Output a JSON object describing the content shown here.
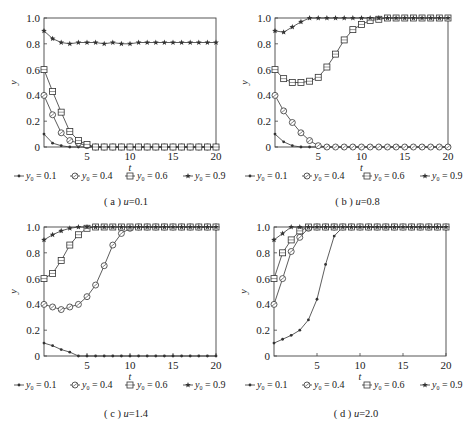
{
  "figure": {
    "legend_prefix": "y",
    "legend_subscript": "0",
    "series_style": {
      "y0_0.1": {
        "marker": "dot",
        "label_value": "0.1"
      },
      "y0_0.4": {
        "marker": "circle",
        "label_value": "0.4"
      },
      "y0_0.6": {
        "marker": "square",
        "label_value": "0.6"
      },
      "y0_0.9": {
        "marker": "star",
        "label_value": "0.9"
      }
    },
    "colors": {
      "line": "#333333",
      "axis": "#444444",
      "background": "#ffffff"
    }
  },
  "chart_data": [
    {
      "type": "line",
      "panel": "a",
      "caption": "( a ) u=0.1",
      "caption_letter": "a",
      "caption_param": "u=0.1",
      "xlabel": "t",
      "ylabel": "y",
      "xlim": [
        0,
        20
      ],
      "ylim": [
        0,
        1.0
      ],
      "xticks": [
        "5",
        "10",
        "15",
        "20"
      ],
      "yticks": [
        "0",
        "0.2",
        "0.4",
        "0.6",
        "0.8",
        "1.0"
      ],
      "grid": false,
      "legend_position": "below",
      "x": [
        0,
        1,
        2,
        3,
        4,
        5,
        6,
        7,
        8,
        9,
        10,
        11,
        12,
        13,
        14,
        15,
        16,
        17,
        18,
        19,
        20
      ],
      "series": [
        {
          "name": "y0 = 0.1",
          "values": [
            0.1,
            0.03,
            0.01,
            0,
            0,
            0,
            0,
            0,
            0,
            0,
            0,
            0,
            0,
            0,
            0,
            0,
            0,
            0,
            0,
            0,
            0
          ]
        },
        {
          "name": "y0 = 0.4",
          "values": [
            0.4,
            0.25,
            0.11,
            0.05,
            0.03,
            0.01,
            0,
            0,
            0,
            0,
            0,
            0,
            0,
            0,
            0,
            0,
            0,
            0,
            0,
            0,
            0
          ]
        },
        {
          "name": "y0 = 0.6",
          "values": [
            0.6,
            0.43,
            0.27,
            0.12,
            0.05,
            0.02,
            0,
            0,
            0,
            0,
            0,
            0,
            0,
            0,
            0,
            0,
            0,
            0,
            0,
            0,
            0
          ]
        },
        {
          "name": "y0 = 0.9",
          "values": [
            0.9,
            0.84,
            0.81,
            0.8,
            0.81,
            0.81,
            0.81,
            0.8,
            0.81,
            0.8,
            0.8,
            0.81,
            0.81,
            0.81,
            0.81,
            0.81,
            0.81,
            0.81,
            0.81,
            0.81,
            0.81
          ]
        }
      ]
    },
    {
      "type": "line",
      "panel": "b",
      "caption": "( b ) u=0.8",
      "caption_letter": "b",
      "caption_param": "u=0.8",
      "xlabel": "t",
      "ylabel": "y",
      "xlim": [
        0,
        20
      ],
      "ylim": [
        0,
        1.0
      ],
      "xticks": [
        "5",
        "10",
        "15",
        "20"
      ],
      "yticks": [
        "0",
        "0.2",
        "0.4",
        "0.6",
        "0.8",
        "1.0"
      ],
      "grid": false,
      "legend_position": "below",
      "x": [
        0,
        1,
        2,
        3,
        4,
        5,
        6,
        7,
        8,
        9,
        10,
        11,
        12,
        13,
        14,
        15,
        16,
        17,
        18,
        19,
        20
      ],
      "series": [
        {
          "name": "y0 = 0.1",
          "values": [
            0.1,
            0.04,
            0.01,
            0,
            0,
            0,
            0,
            0,
            0,
            0,
            0,
            0,
            0,
            0,
            0,
            0,
            0,
            0,
            0,
            0,
            0
          ]
        },
        {
          "name": "y0 = 0.4",
          "values": [
            0.4,
            0.28,
            0.19,
            0.11,
            0.05,
            0.01,
            0,
            0,
            0,
            0,
            0,
            0,
            0,
            0,
            0,
            0,
            0,
            0,
            0,
            0,
            0
          ]
        },
        {
          "name": "y0 = 0.6",
          "values": [
            0.6,
            0.53,
            0.5,
            0.5,
            0.51,
            0.54,
            0.62,
            0.72,
            0.83,
            0.91,
            0.95,
            0.98,
            0.99,
            1.0,
            1.0,
            1.0,
            1.0,
            1.0,
            1.0,
            1.0,
            1.0
          ]
        },
        {
          "name": "y0 = 0.9",
          "values": [
            0.9,
            0.89,
            0.93,
            0.97,
            1.0,
            1.0,
            1.0,
            1.0,
            1.0,
            1.0,
            1.0,
            1.0,
            1.0,
            1.0,
            1.0,
            1.0,
            1.0,
            1.0,
            1.0,
            1.0,
            1.0
          ]
        }
      ]
    },
    {
      "type": "line",
      "panel": "c",
      "caption": "( c ) u=1.4",
      "caption_letter": "c",
      "caption_param": "u=1.4",
      "xlabel": "t",
      "ylabel": "y",
      "xlim": [
        0,
        20
      ],
      "ylim": [
        0,
        1.0
      ],
      "xticks": [
        "5",
        "10",
        "15",
        "20"
      ],
      "yticks": [
        "0",
        "0.2",
        "0.4",
        "0.6",
        "0.8",
        "1.0"
      ],
      "grid": false,
      "legend_position": "below",
      "x": [
        0,
        1,
        2,
        3,
        4,
        5,
        6,
        7,
        8,
        9,
        10,
        11,
        12,
        13,
        14,
        15,
        16,
        17,
        18,
        19,
        20
      ],
      "series": [
        {
          "name": "y0 = 0.1",
          "values": [
            0.1,
            0.08,
            0.05,
            0.03,
            0,
            0,
            0,
            0,
            0,
            0,
            0,
            0,
            0,
            0,
            0,
            0,
            0,
            0,
            0,
            0,
            0
          ]
        },
        {
          "name": "y0 = 0.4",
          "values": [
            0.4,
            0.38,
            0.36,
            0.38,
            0.4,
            0.46,
            0.55,
            0.7,
            0.86,
            0.95,
            0.99,
            1.0,
            1.0,
            1.0,
            1.0,
            1.0,
            1.0,
            1.0,
            1.0,
            1.0,
            1.0
          ]
        },
        {
          "name": "y0 = 0.6",
          "values": [
            0.6,
            0.64,
            0.74,
            0.86,
            0.94,
            0.99,
            1.0,
            1.0,
            1.0,
            1.0,
            1.0,
            1.0,
            1.0,
            1.0,
            1.0,
            1.0,
            1.0,
            1.0,
            1.0,
            1.0,
            1.0
          ]
        },
        {
          "name": "y0 = 0.9",
          "values": [
            0.9,
            0.94,
            0.97,
            0.99,
            1.0,
            1.0,
            1.0,
            1.0,
            1.0,
            1.0,
            1.0,
            1.0,
            1.0,
            1.0,
            1.0,
            1.0,
            1.0,
            1.0,
            1.0,
            1.0,
            1.0
          ]
        }
      ]
    },
    {
      "type": "line",
      "panel": "d",
      "caption": "( d ) u=2.0",
      "caption_letter": "d",
      "caption_param": "u=2.0",
      "xlabel": "t",
      "ylabel": "y",
      "xlim": [
        0,
        20
      ],
      "ylim": [
        0,
        1.0
      ],
      "xticks": [
        "5",
        "10",
        "15",
        "20"
      ],
      "yticks": [
        "0",
        "0.2",
        "0.4",
        "0.6",
        "0.8",
        "1.0"
      ],
      "grid": false,
      "legend_position": "below",
      "x": [
        0,
        1,
        2,
        3,
        4,
        5,
        6,
        7,
        8,
        9,
        10,
        11,
        12,
        13,
        14,
        15,
        16,
        17,
        18,
        19,
        20
      ],
      "series": [
        {
          "name": "y0 = 0.1",
          "values": [
            0.1,
            0.13,
            0.16,
            0.2,
            0.28,
            0.44,
            0.71,
            0.93,
            1.0,
            1.0,
            1.0,
            1.0,
            1.0,
            1.0,
            1.0,
            1.0,
            1.0,
            1.0,
            1.0,
            1.0,
            1.0
          ]
        },
        {
          "name": "y0 = 0.4",
          "values": [
            0.4,
            0.6,
            0.81,
            0.92,
            0.99,
            1.0,
            1.0,
            1.0,
            1.0,
            1.0,
            1.0,
            1.0,
            1.0,
            1.0,
            1.0,
            1.0,
            1.0,
            1.0,
            1.0,
            1.0,
            1.0
          ]
        },
        {
          "name": "y0 = 0.6",
          "values": [
            0.6,
            0.8,
            0.9,
            0.97,
            1.0,
            1.0,
            1.0,
            1.0,
            1.0,
            1.0,
            1.0,
            1.0,
            1.0,
            1.0,
            1.0,
            1.0,
            1.0,
            1.0,
            1.0,
            1.0,
            1.0
          ]
        },
        {
          "name": "y0 = 0.9",
          "values": [
            0.9,
            0.95,
            1.0,
            1.0,
            1.0,
            1.0,
            1.0,
            1.0,
            1.0,
            1.0,
            1.0,
            1.0,
            1.0,
            1.0,
            1.0,
            1.0,
            1.0,
            1.0,
            1.0,
            1.0,
            1.0
          ]
        }
      ]
    }
  ]
}
